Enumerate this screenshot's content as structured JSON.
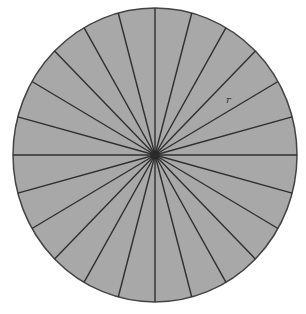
{
  "diagram": {
    "type": "circle-divided-into-sectors",
    "sector_count": 24,
    "label": "r",
    "colors": {
      "fill": "#a8a8a8",
      "stroke": "#333333",
      "background": "#ffffff"
    }
  }
}
